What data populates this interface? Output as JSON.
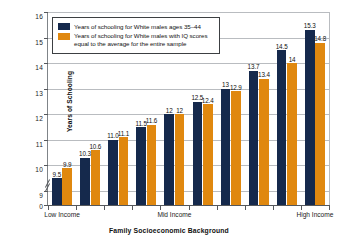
{
  "chart_data": {
    "type": "bar",
    "title": "",
    "xlabel": "Family Socioeconomic Background",
    "ylabel": "Years of Schooling",
    "ylim": [
      9,
      16
    ],
    "yticks": [
      "0",
      "9",
      "10",
      "11",
      "12",
      "13",
      "14",
      "15",
      "16"
    ],
    "axis_break": true,
    "grid": true,
    "legend_position": "top-left",
    "categories": [
      "1",
      "2",
      "3",
      "4",
      "5",
      "6",
      "7",
      "8",
      "9",
      "10"
    ],
    "xtick_labels": [
      "Low Income",
      "Mid Income",
      "High Income"
    ],
    "series": [
      {
        "name": "Years of schooling for White males ages 35–44",
        "color": "#15294c",
        "values": [
          9.5,
          10.3,
          11.0,
          11.5,
          12,
          12.5,
          13,
          13.7,
          14.5,
          15.3
        ],
        "labels": [
          "9.5",
          "10.3",
          "11.0",
          "11.5",
          "12",
          "12.5",
          "13",
          "13.7",
          "14.5",
          "15.3"
        ]
      },
      {
        "name": "Years of schooling for White males with IQ scores equal to the average for the entire sample",
        "color": "#e0880f",
        "values": [
          9.9,
          10.6,
          11.1,
          11.6,
          12,
          12.4,
          12.9,
          13.4,
          14,
          14.8
        ],
        "labels": [
          "9.9",
          "10.6",
          "11.1",
          "11.6",
          "12",
          "12.4",
          "12.9",
          "13.4",
          "14",
          "14.8"
        ]
      }
    ]
  },
  "legend": {
    "items": [
      {
        "swatch": "primary",
        "line1": "Years of schooling for White males ages 35–44",
        "line2": ""
      },
      {
        "swatch": "secondary",
        "line1": "Years of schooling for White males with IQ scores",
        "line2": "equal to the average for the entire sample"
      }
    ]
  },
  "axes": {
    "y_title": "Years of Schooling",
    "x_title": "Family Socioeconomic Background",
    "y_labels": [
      "16",
      "15",
      "14",
      "13",
      "12",
      "11",
      "10",
      "9",
      "0"
    ],
    "x_labels": [
      "Low Income",
      "Mid Income",
      "High Income"
    ]
  }
}
